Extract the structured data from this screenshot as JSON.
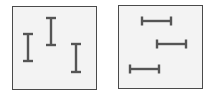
{
  "colors": {
    "background": "#ffffff",
    "panel_fill": "#f3f3f3",
    "panel_border": "#4a4a4a",
    "glyph_stroke": "#555555"
  },
  "panels": [
    {
      "name": "vertical-bars-panel",
      "box": {
        "x": 12,
        "y": 6,
        "w": 85,
        "h": 84
      },
      "orientation": "vertical",
      "glyphs": [
        {
          "cx": 28,
          "y1": 34,
          "y2": 61,
          "cap": 10
        },
        {
          "cx": 51,
          "y1": 18,
          "y2": 45,
          "cap": 10
        },
        {
          "cx": 76,
          "y1": 44,
          "y2": 72,
          "cap": 10
        }
      ]
    },
    {
      "name": "horizontal-bars-panel",
      "box": {
        "x": 118,
        "y": 5,
        "w": 85,
        "h": 84
      },
      "orientation": "horizontal",
      "glyphs": [
        {
          "cy": 21,
          "x1": 142,
          "x2": 171,
          "cap": 9
        },
        {
          "cy": 44,
          "x1": 157,
          "x2": 186,
          "cap": 9
        },
        {
          "cy": 69,
          "x1": 130,
          "x2": 159,
          "cap": 9
        }
      ]
    }
  ]
}
